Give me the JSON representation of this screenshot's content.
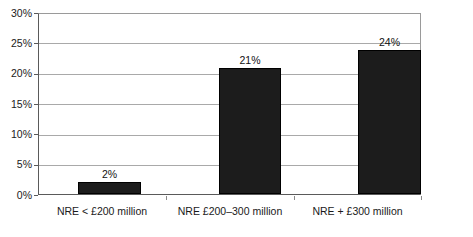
{
  "chart_data": {
    "type": "bar",
    "title": "",
    "subtitle": "",
    "xlabel": "",
    "ylabel": "",
    "categories": [
      "NRE < £200 million",
      "NRE £200–300 million",
      "NRE + £300 million"
    ],
    "values": [
      2,
      21,
      24
    ],
    "value_labels": [
      "2%",
      "21%",
      "24%"
    ],
    "ylim": [
      0,
      30
    ],
    "ytick_values": [
      0,
      5,
      10,
      15,
      20,
      25,
      30
    ],
    "ytick_labels": [
      "0%",
      "5%",
      "10%",
      "15%",
      "20%",
      "25%",
      "30%"
    ],
    "grid": "horizontal",
    "legend": "none",
    "series": [
      {
        "name": "",
        "values": [
          2,
          21,
          24
        ],
        "color": "#1c1c1c"
      }
    ],
    "bar_color": "#1c1c1c",
    "gridline_color": "#a9a9a9",
    "axis_color": "#5a5a5a",
    "background_color": "#ffffff"
  }
}
